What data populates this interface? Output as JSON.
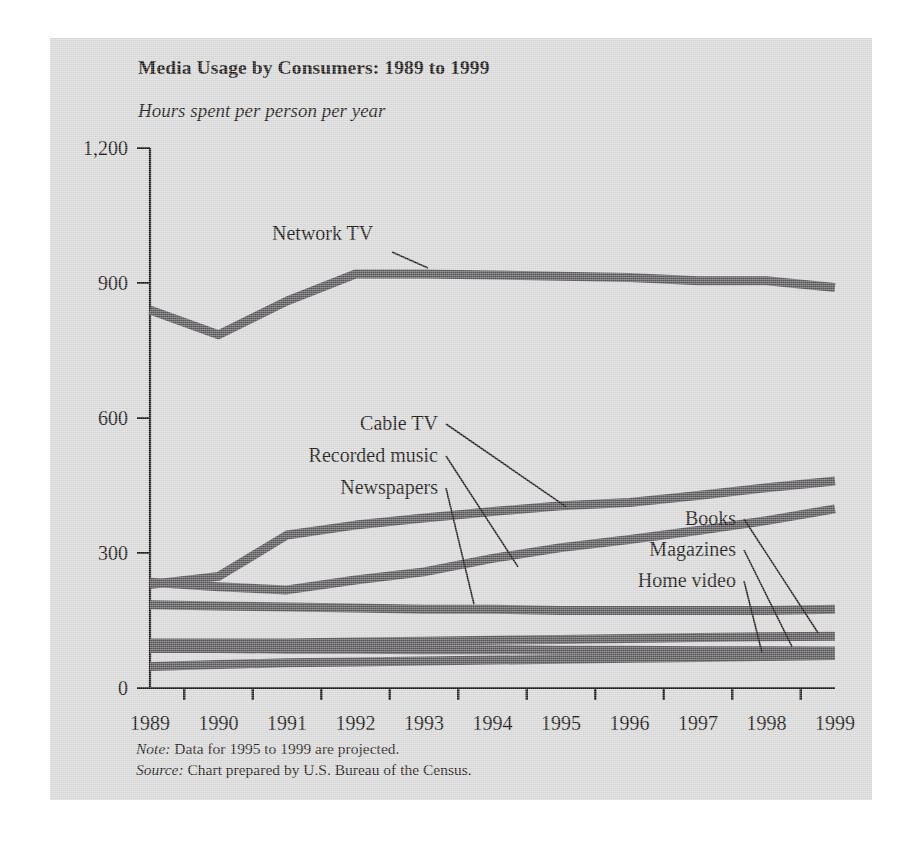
{
  "figure": {
    "title": "Media Usage by Consumers: 1989 to 1999",
    "subtitle": "Hours spent per person per year",
    "note_keyword": "Note:",
    "note_text": " Data for 1995 to 1999 are projected.",
    "source_keyword": "Source:",
    "source_text": " Chart prepared by U.S. Bureau of the Census.",
    "panel_color": "#d9d9d9",
    "line_color": "#58565a",
    "axis_color": "#1b1714"
  },
  "chart_data": {
    "type": "line",
    "title": "Media Usage by Consumers: 1989 to 1999",
    "subtitle": "Hours spent per person per year",
    "xlabel": "",
    "ylabel": "Hours spent per person per year",
    "x": [
      1989,
      1990,
      1991,
      1992,
      1993,
      1994,
      1995,
      1996,
      1997,
      1998,
      1999
    ],
    "xtick_labels": [
      "1989",
      "1990",
      "1991",
      "1992",
      "1993",
      "1994",
      "1995",
      "1996",
      "1997",
      "1998",
      "1999"
    ],
    "ylim": [
      0,
      1200
    ],
    "yticks": [
      0,
      300,
      600,
      900,
      1200
    ],
    "ytick_labels": [
      "0",
      "300",
      "600",
      "900",
      "1,200"
    ],
    "grid": false,
    "legend": "inline-labels",
    "series": [
      {
        "name": "Network TV",
        "values": [
          840,
          785,
          860,
          920,
          920,
          918,
          915,
          912,
          905,
          905,
          890
        ]
      },
      {
        "name": "Cable TV",
        "values": [
          230,
          248,
          340,
          362,
          378,
          392,
          405,
          412,
          428,
          445,
          460
        ]
      },
      {
        "name": "Recorded music",
        "values": [
          235,
          225,
          218,
          240,
          258,
          288,
          312,
          330,
          350,
          372,
          398
        ]
      },
      {
        "name": "Newspapers",
        "values": [
          185,
          182,
          180,
          178,
          175,
          175,
          172,
          172,
          172,
          172,
          175
        ]
      },
      {
        "name": "Books",
        "values": [
          100,
          100,
          100,
          102,
          104,
          106,
          108,
          110,
          112,
          114,
          115
        ]
      },
      {
        "name": "Magazines",
        "values": [
          88,
          88,
          86,
          86,
          85,
          85,
          84,
          84,
          83,
          83,
          82
        ]
      },
      {
        "name": "Home video",
        "values": [
          48,
          52,
          56,
          58,
          60,
          62,
          64,
          66,
          68,
          70,
          72
        ]
      }
    ],
    "annotations": [
      {
        "label": "Network TV",
        "side": "left"
      },
      {
        "label": "Cable TV",
        "side": "left"
      },
      {
        "label": "Recorded music",
        "side": "left"
      },
      {
        "label": "Newspapers",
        "side": "left"
      },
      {
        "label": "Books",
        "side": "right"
      },
      {
        "label": "Magazines",
        "side": "right"
      },
      {
        "label": "Home video",
        "side": "right"
      }
    ]
  }
}
